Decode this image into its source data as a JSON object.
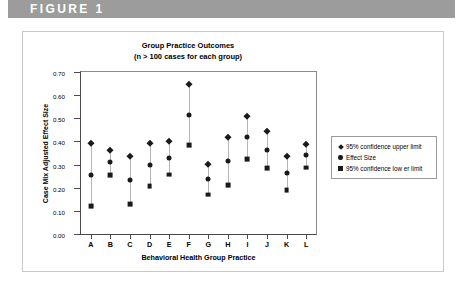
{
  "banner": {
    "label": "FIGURE 1"
  },
  "chart_data": {
    "type": "scatter",
    "title": "Group Practice Outcomes",
    "subtitle": "(n > 100 cases for each group)",
    "xlabel": "Behavioral Health Group Practice",
    "ylabel": "Case Mix Adjusted Effect Size",
    "ylim": [
      0.0,
      0.7
    ],
    "ytick_labels": [
      "0.00",
      "0.10",
      "0.20",
      "0.30",
      "0.40",
      "0.50",
      "0.60",
      "0.70"
    ],
    "ytick_values": [
      0.0,
      0.1,
      0.2,
      0.3,
      0.4,
      0.5,
      0.6,
      0.7
    ],
    "grid": false,
    "legend_position": "right",
    "categories": [
      "A",
      "B",
      "C",
      "D",
      "E",
      "F",
      "G",
      "H",
      "I",
      "J",
      "K",
      "L"
    ],
    "series": [
      {
        "name": "95% confidence upper limit",
        "marker": "diamond",
        "color": "#1a1a1a",
        "values": [
          0.395,
          0.365,
          0.335,
          0.393,
          0.4,
          0.648,
          0.303,
          0.417,
          0.51,
          0.445,
          0.335,
          0.39
        ]
      },
      {
        "name": "Effect Size",
        "marker": "circle",
        "color": "#1a1a1a",
        "values": [
          0.257,
          0.31,
          0.232,
          0.3,
          0.33,
          0.515,
          0.238,
          0.315,
          0.417,
          0.365,
          0.262,
          0.34
        ]
      },
      {
        "name": "95% confidence low er limit",
        "marker": "square",
        "color": "#1a1a1a",
        "values": [
          0.122,
          0.253,
          0.128,
          0.208,
          0.257,
          0.383,
          0.17,
          0.212,
          0.322,
          0.285,
          0.188,
          0.287
        ]
      }
    ]
  }
}
